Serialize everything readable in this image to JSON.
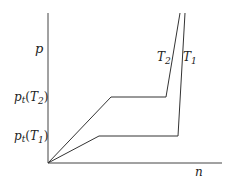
{
  "diagram": {
    "y_axis_label": "p",
    "x_axis_label": "n",
    "curves": [
      {
        "name": "T2",
        "label_main": "T",
        "label_sub": "2",
        "points": [
          [
            48,
            163
          ],
          [
            111,
            97
          ],
          [
            166,
            97
          ],
          [
            180,
            13
          ]
        ]
      },
      {
        "name": "T1",
        "label_main": "T",
        "label_sub": "1",
        "points": [
          [
            48,
            163
          ],
          [
            99,
            136
          ],
          [
            178,
            136
          ],
          [
            185,
            13
          ]
        ]
      }
    ],
    "y_ticks": [
      {
        "main": "p",
        "sub_t": "t",
        "arg_main": "T",
        "arg_sub": "2",
        "y": 97
      },
      {
        "main": "p",
        "sub_t": "t",
        "arg_main": "T",
        "arg_sub": "1",
        "y": 136
      }
    ],
    "line_color": "#333333"
  }
}
